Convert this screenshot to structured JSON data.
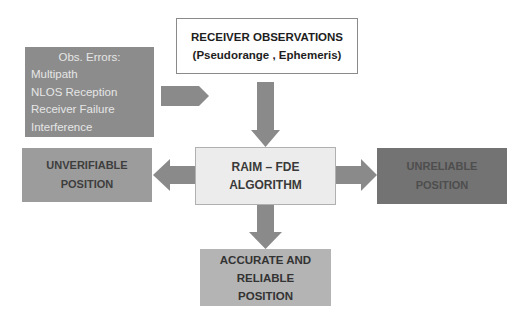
{
  "diagram": {
    "observations_box": {
      "line1": "RECEIVER OBSERVATIONS",
      "line2": "(Pseudorange , Ephemeris)"
    },
    "errors_box": {
      "header": "Obs. Errors:",
      "items": [
        "Multipath",
        "NLOS Reception",
        "Receiver Failure",
        "Interference"
      ]
    },
    "raim_box": {
      "line1": "RAIM – FDE",
      "line2": "ALGORITHM"
    },
    "unverifiable_box": {
      "line1": "UNVERIFIABLE",
      "line2": "POSITION"
    },
    "unreliable_box": {
      "line1": "UNRELIABLE",
      "line2": "POSITION"
    },
    "accurate_box": {
      "line1": "ACCURATE AND",
      "line2": "RELIABLE",
      "line3": "POSITION"
    },
    "colors": {
      "arrow": "#8a8a8a",
      "errors_fill": "#8c8c8c",
      "raim_fill": "#ececec",
      "unverifiable_fill": "#9c9c9c",
      "unreliable_fill": "#737373",
      "accurate_fill": "#b4b4b4"
    }
  }
}
